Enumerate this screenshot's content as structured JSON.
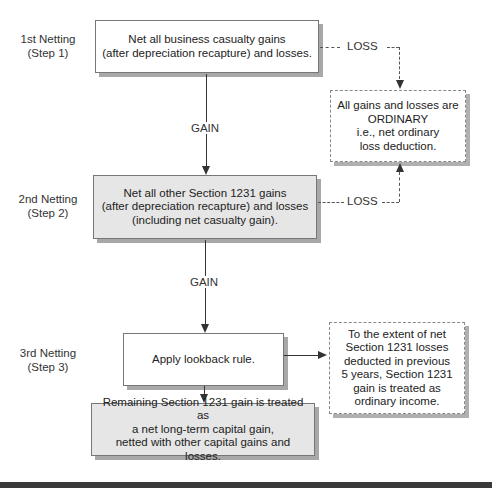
{
  "steps": [
    {
      "line1": "1st Netting",
      "line2": "(Step 1)"
    },
    {
      "line1": "2nd Netting",
      "line2": "(Step 2)"
    },
    {
      "line1": "3rd Netting",
      "line2": "(Step 3)"
    }
  ],
  "boxes": {
    "step1": {
      "lines": [
        "Net all business casualty gains",
        "(after depreciation recapture) and losses."
      ]
    },
    "ordinary": {
      "lines": [
        "All gains and losses are",
        "ORDINARY",
        "i.e., net ordinary",
        "loss deduction."
      ]
    },
    "step2": {
      "lines": [
        "Net all other Section 1231 gains",
        "(after depreciation recapture) and losses",
        "(including net casualty gain)."
      ]
    },
    "step3": {
      "lines": [
        "Apply lookback rule."
      ]
    },
    "lookback": {
      "lines": [
        "To the extent of net",
        "Section 1231 losses",
        "deducted in previous",
        "5 years, Section 1231",
        "gain is treated as",
        "ordinary income."
      ]
    },
    "final": {
      "lines": [
        "Remaining Section 1231 gain is treated as",
        "a net long-term capital gain,",
        "netted with other capital gains and losses."
      ]
    }
  },
  "edges": {
    "gain1": "GAIN",
    "gain2": "GAIN",
    "loss1": "LOSS",
    "loss2": "LOSS"
  }
}
